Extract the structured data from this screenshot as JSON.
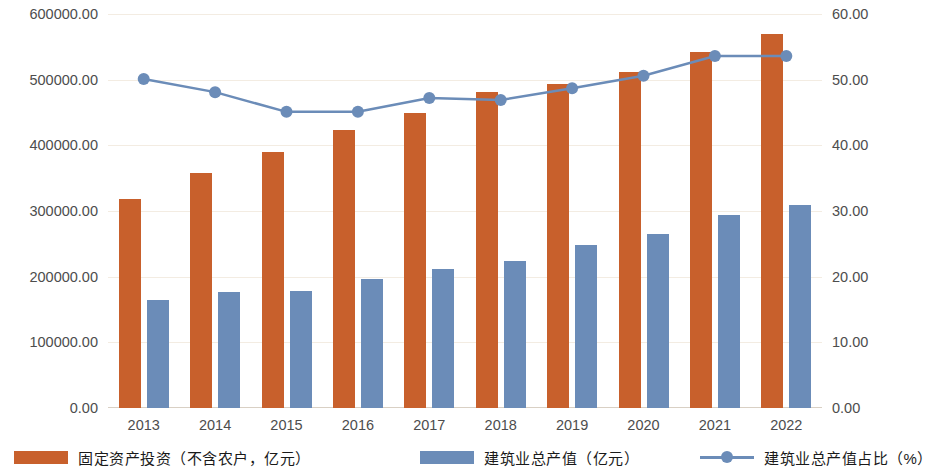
{
  "chart_data": {
    "type": "bar",
    "title": "",
    "subtitle": "",
    "xlabel": "",
    "ylabel": "",
    "categories": [
      "2013",
      "2014",
      "2015",
      "2016",
      "2017",
      "2018",
      "2019",
      "2020",
      "2021",
      "2022"
    ],
    "grid": true,
    "legend_position": "bottom",
    "axes": {
      "left": {
        "label": "",
        "min": 0,
        "max": 600000,
        "step": 100000,
        "ticks": [
          "0.00",
          "100000.00",
          "200000.00",
          "300000.00",
          "400000.00",
          "500000.00",
          "600000.00"
        ]
      },
      "right": {
        "label": "",
        "min": 0,
        "max": 60,
        "step": 10,
        "ticks": [
          "0.00",
          "10.00",
          "20.00",
          "30.00",
          "40.00",
          "50.00",
          "60.00"
        ]
      }
    },
    "series": [
      {
        "name": "固定资产投资（不含农户，亿元）",
        "type": "bar",
        "axis": "left",
        "color": "#c8602c",
        "values": [
          318000,
          358000,
          390000,
          423000,
          450000,
          481000,
          493000,
          511000,
          542000,
          569000
        ]
      },
      {
        "name": "建筑业总产值（亿元）",
        "type": "bar",
        "axis": "left",
        "color": "#6b8cb8",
        "values": [
          164000,
          177000,
          178000,
          196000,
          212000,
          224000,
          248000,
          265000,
          294000,
          309000
        ]
      },
      {
        "name": "建筑业总产值占比（%）",
        "type": "line",
        "axis": "right",
        "color": "#6b8cb8",
        "marker": "circle",
        "values": [
          50.1,
          48.1,
          45.1,
          45.1,
          47.2,
          46.9,
          48.7,
          50.6,
          53.6,
          53.6
        ]
      }
    ]
  },
  "legend": {
    "items": [
      {
        "label": "固定资产投资（不含农户，亿元）",
        "marker": "orange-square"
      },
      {
        "label": "建筑业总产值（亿元）",
        "marker": "blue-square"
      },
      {
        "label": "建筑业总产值占比（%）",
        "marker": "blue-line-circle"
      }
    ]
  }
}
